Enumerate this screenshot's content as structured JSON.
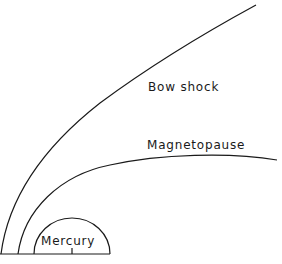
{
  "diagram": {
    "labels": {
      "bow_shock": "Bow shock",
      "magnetopause": "Magnetopause",
      "planet": "Mercury"
    },
    "colors": {
      "line": "#1a1a1a",
      "background": "#ffffff"
    }
  }
}
